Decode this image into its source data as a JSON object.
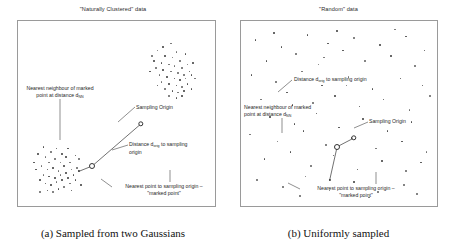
{
  "figure": {
    "panels": [
      {
        "id": "panel-a",
        "title": "\"Naturally Clustered\" data",
        "caption": "(a) Sampled from two Gaussians",
        "annotations": {
          "nearest_neighbour_line1": "Nearest neighbour of marked",
          "nearest_neighbour_line2": "point at distance d",
          "nearest_neighbour_sub": "NN",
          "sampling_origin": "Sampling Origin",
          "distance_prefix": "Distance d",
          "distance_sub": "orig",
          "distance_suffix": " to sampling",
          "distance_line2": "origin",
          "marked_point_line1": "Nearest point to sampling origin –",
          "marked_point_line2": "\"marked point\""
        }
      },
      {
        "id": "panel-b",
        "title": "\"Random\" data",
        "caption": "(b) Uniformly sampled",
        "annotations": {
          "distance_prefix": "Distance d",
          "distance_sub": "orig",
          "distance_suffix": " to sampling origin",
          "nearest_neighbour_line1": "Nearest neighbour of marked",
          "nearest_neighbour_line2": "point at distance d",
          "nearest_neighbour_sub": "NN",
          "sampling_origin": "Sampling Origin",
          "marked_point_line1": "Nearest point to sampling origin –",
          "marked_point_line2": "\"marked point\""
        }
      }
    ]
  },
  "chart_data": {
    "type": "scatter",
    "xlabel": "",
    "ylabel": "",
    "grid": false,
    "legend": "none",
    "xlim": [
      0,
      100
    ],
    "ylim": [
      0,
      100
    ],
    "panels": [
      {
        "name": "\"Naturally Clustered\" data",
        "caption": "(a) Sampled from two Gaussians",
        "distribution": "two Gaussians",
        "points": [
          [
            72,
            86
          ],
          [
            75,
            88
          ],
          [
            79,
            90
          ],
          [
            82,
            85
          ],
          [
            76,
            83
          ],
          [
            80,
            82
          ],
          [
            84,
            80
          ],
          [
            70,
            80
          ],
          [
            74,
            79
          ],
          [
            78,
            78
          ],
          [
            81,
            77
          ],
          [
            85,
            76
          ],
          [
            88,
            78
          ],
          [
            71,
            76
          ],
          [
            75,
            75
          ],
          [
            79,
            74
          ],
          [
            83,
            73
          ],
          [
            86,
            72
          ],
          [
            89,
            74
          ],
          [
            73,
            72
          ],
          [
            77,
            71
          ],
          [
            81,
            70
          ],
          [
            84,
            69
          ],
          [
            87,
            70
          ],
          [
            90,
            72
          ],
          [
            74,
            68
          ],
          [
            78,
            67
          ],
          [
            82,
            66
          ],
          [
            85,
            65
          ],
          [
            88,
            67
          ],
          [
            76,
            64
          ],
          [
            80,
            63
          ],
          [
            83,
            62
          ],
          [
            86,
            63
          ],
          [
            78,
            60
          ],
          [
            82,
            59
          ],
          [
            85,
            60
          ],
          [
            91,
            79
          ],
          [
            69,
            83
          ],
          [
            92,
            70
          ],
          [
            87,
            84
          ],
          [
            72,
            66
          ],
          [
            90,
            64
          ],
          [
            68,
            74
          ],
          [
            12,
            25
          ],
          [
            15,
            28
          ],
          [
            18,
            30
          ],
          [
            21,
            27
          ],
          [
            14,
            22
          ],
          [
            17,
            24
          ],
          [
            20,
            22
          ],
          [
            23,
            25
          ],
          [
            10,
            20
          ],
          [
            13,
            18
          ],
          [
            16,
            19
          ],
          [
            19,
            17
          ],
          [
            22,
            20
          ],
          [
            25,
            22
          ],
          [
            11,
            15
          ],
          [
            14,
            14
          ],
          [
            17,
            13
          ],
          [
            20,
            15
          ],
          [
            23,
            16
          ],
          [
            26,
            18
          ],
          [
            9,
            12
          ],
          [
            12,
            10
          ],
          [
            15,
            9
          ],
          [
            18,
            11
          ],
          [
            21,
            12
          ],
          [
            24,
            13
          ],
          [
            27,
            15
          ],
          [
            13,
            6
          ],
          [
            16,
            5
          ],
          [
            19,
            7
          ],
          [
            22,
            8
          ],
          [
            25,
            10
          ],
          [
            28,
            12
          ],
          [
            8,
            27
          ],
          [
            29,
            19
          ],
          [
            7,
            18
          ],
          [
            30,
            24
          ],
          [
            11,
            31
          ],
          [
            26,
            6
          ],
          [
            6,
            22
          ],
          [
            31,
            9
          ],
          [
            24,
            30
          ],
          [
            9,
            5
          ],
          [
            28,
            26
          ]
        ],
        "sampling_origin": [
          63,
          44
        ],
        "marked_point": [
          37,
          20
        ],
        "nearest_neighbour": [
          30,
          17
        ],
        "d_orig_label": "Distance d_orig to sampling origin",
        "d_nn_label": "Nearest neighbour of marked point at distance d_NN"
      },
      {
        "name": "\"Random\" data",
        "caption": "(b) Uniformly sampled",
        "distribution": "uniform",
        "points": [
          [
            5,
            92
          ],
          [
            19,
            88
          ],
          [
            33,
            95
          ],
          [
            44,
            90
          ],
          [
            58,
            93
          ],
          [
            72,
            89
          ],
          [
            86,
            94
          ],
          [
            96,
            86
          ],
          [
            11,
            80
          ],
          [
            27,
            84
          ],
          [
            39,
            78
          ],
          [
            52,
            86
          ],
          [
            64,
            80
          ],
          [
            78,
            83
          ],
          [
            91,
            77
          ],
          [
            3,
            72
          ],
          [
            16,
            68
          ],
          [
            30,
            74
          ],
          [
            41,
            66
          ],
          [
            55,
            71
          ],
          [
            68,
            64
          ],
          [
            83,
            70
          ],
          [
            95,
            66
          ],
          [
            8,
            58
          ],
          [
            22,
            62
          ],
          [
            36,
            56
          ],
          [
            48,
            60
          ],
          [
            61,
            54
          ],
          [
            74,
            58
          ],
          [
            88,
            52
          ],
          [
            99,
            60
          ],
          [
            13,
            48
          ],
          [
            26,
            44
          ],
          [
            38,
            50
          ],
          [
            50,
            42
          ],
          [
            63,
            47
          ],
          [
            76,
            40
          ],
          [
            89,
            45
          ],
          [
            2,
            38
          ],
          [
            17,
            34
          ],
          [
            31,
            40
          ],
          [
            43,
            32
          ],
          [
            57,
            36
          ],
          [
            70,
            30
          ],
          [
            84,
            34
          ],
          [
            97,
            28
          ],
          [
            10,
            24
          ],
          [
            24,
            28
          ],
          [
            35,
            20
          ],
          [
            47,
            26
          ],
          [
            60,
            18
          ],
          [
            73,
            23
          ],
          [
            86,
            17
          ],
          [
            94,
            22
          ],
          [
            6,
            12
          ],
          [
            20,
            8
          ],
          [
            32,
            14
          ],
          [
            45,
            6
          ],
          [
            58,
            11
          ],
          [
            71,
            5
          ],
          [
            85,
            9
          ],
          [
            92,
            4
          ],
          [
            15,
            96
          ],
          [
            49,
            97
          ],
          [
            66,
            2
          ],
          [
            29,
            3
          ],
          [
            80,
            98
          ],
          [
            54,
            66
          ],
          [
            42,
            82
          ],
          [
            25,
            55
          ]
        ],
        "sampling_origin": [
          58,
          36
        ],
        "marked_point": [
          49,
          31
        ],
        "nearest_neighbour": [
          45,
          12
        ],
        "d_orig_label": "Distance d_orig to sampling origin",
        "d_nn_label": "Nearest neighbour of marked point at distance d_NN"
      }
    ]
  }
}
